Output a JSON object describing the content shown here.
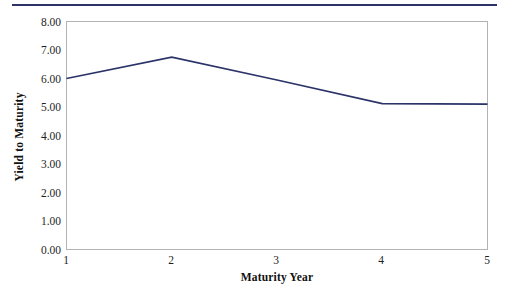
{
  "figure": {
    "background_color": "#ffffff",
    "top_rule_color": "#2b3368",
    "frame_color": "#b3b3b3"
  },
  "chart_data": {
    "type": "line",
    "title": "",
    "subtitle": "",
    "xlabel": "Maturity Year",
    "ylabel": "Yield to Maturity",
    "x": [
      1,
      2,
      3,
      4,
      5
    ],
    "values": [
      6.0,
      6.75,
      5.95,
      5.12,
      5.1
    ],
    "series": [
      {
        "name": "Yield to Maturity",
        "color": "#2b3368",
        "values": [
          6.0,
          6.75,
          5.95,
          5.12,
          5.1
        ]
      }
    ],
    "xlim": [
      1,
      5
    ],
    "ylim": [
      0.0,
      8.0
    ],
    "x_tick_labels": [
      "1",
      "2",
      "3",
      "4",
      "5"
    ],
    "y_tick_labels": [
      "0.00",
      "1.00",
      "2.00",
      "3.00",
      "4.00",
      "5.00",
      "6.00",
      "7.00",
      "8.00"
    ],
    "y_tick_values": [
      0,
      1,
      2,
      3,
      4,
      5,
      6,
      7,
      8
    ],
    "grid": false,
    "legend": false,
    "legend_position": "none",
    "line_color": "#2b3368",
    "line_width": 1.6,
    "markers": false,
    "annotations": []
  },
  "axes": {
    "y_label": "Yield to Maturity",
    "x_label": "Maturity Year",
    "y_ticks": [
      {
        "label": "8.00",
        "value": 8
      },
      {
        "label": "7.00",
        "value": 7
      },
      {
        "label": "6.00",
        "value": 6
      },
      {
        "label": "5.00",
        "value": 5
      },
      {
        "label": "4.00",
        "value": 4
      },
      {
        "label": "3.00",
        "value": 3
      },
      {
        "label": "2.00",
        "value": 2
      },
      {
        "label": "1.00",
        "value": 1
      },
      {
        "label": "0.00",
        "value": 0
      }
    ],
    "x_ticks": [
      {
        "label": "1",
        "value": 1
      },
      {
        "label": "2",
        "value": 2
      },
      {
        "label": "3",
        "value": 3
      },
      {
        "label": "4",
        "value": 4
      },
      {
        "label": "5",
        "value": 5
      }
    ]
  }
}
